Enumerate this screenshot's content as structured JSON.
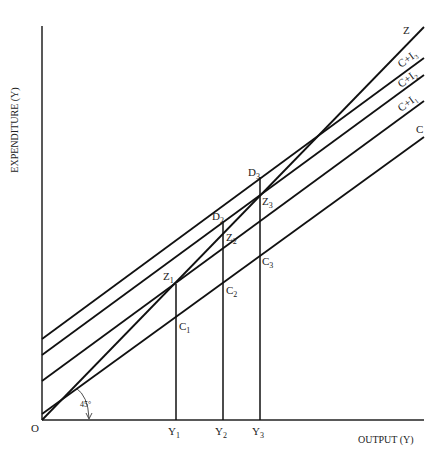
{
  "axes": {
    "y_label": "EXPENDITURE (Y)",
    "x_label": "OUTPUT (Y)",
    "origin_label": "O",
    "angle_label": "45°"
  },
  "lines": [
    {
      "name": "Z",
      "label": "Z",
      "x1": 42,
      "y1": 420,
      "x2": 424,
      "y2": 27,
      "lx": 403,
      "ly": 34
    },
    {
      "name": "C+I3",
      "label": "C+I₃",
      "x1": 42,
      "y1": 339,
      "x2": 424,
      "y2": 58,
      "lx": 401,
      "ly": 68
    },
    {
      "name": "C+I2",
      "label": "C+I₂",
      "x1": 42,
      "y1": 355,
      "x2": 424,
      "y2": 75,
      "lx": 401,
      "ly": 88
    },
    {
      "name": "C+I1",
      "label": "C+I₁",
      "x1": 42,
      "y1": 381,
      "x2": 424,
      "y2": 101,
      "lx": 401,
      "ly": 112
    },
    {
      "name": "C",
      "label": "C",
      "x1": 42,
      "y1": 414,
      "x2": 424,
      "y2": 137,
      "lx": 416,
      "ly": 133
    }
  ],
  "verticals": [
    {
      "name": "Y1",
      "x": 176,
      "top": 284
    },
    {
      "name": "Y2",
      "x": 223,
      "top": 221
    },
    {
      "name": "Y3",
      "x": 260,
      "top": 177
    }
  ],
  "x_ticks": [
    {
      "label": "Y",
      "sub": "1",
      "x": 168
    },
    {
      "label": "Y",
      "sub": "2",
      "x": 215
    },
    {
      "label": "Y",
      "sub": "3",
      "x": 252
    }
  ],
  "point_labels": [
    {
      "label": "Z",
      "sub": "1",
      "x": 163,
      "y": 280
    },
    {
      "label": "C",
      "sub": "1",
      "x": 179,
      "y": 330
    },
    {
      "label": "C",
      "sub": "2",
      "x": 226,
      "y": 294
    },
    {
      "label": "D",
      "sub": "2",
      "x": 212,
      "y": 220
    },
    {
      "label": "Z",
      "sub": "2",
      "x": 226,
      "y": 241
    },
    {
      "label": "D",
      "sub": "3",
      "x": 248,
      "y": 176
    },
    {
      "label": "Z",
      "sub": "3",
      "x": 262,
      "y": 205
    },
    {
      "label": "C",
      "sub": "3",
      "x": 262,
      "y": 265
    }
  ]
}
